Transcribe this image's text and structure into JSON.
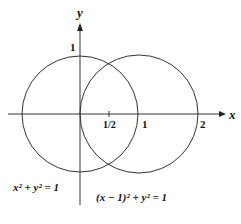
{
  "diagram": {
    "axes": {
      "x_label": "x",
      "y_label": "y",
      "ticks": {
        "x_half": "1/2",
        "x_one": "1",
        "x_two": "2",
        "y_one": "1"
      }
    },
    "curves": [
      {
        "equation": "x² + y² = 1",
        "center": [
          0,
          0
        ],
        "radius": 1
      },
      {
        "equation": "(x − 1)² + y² = 1",
        "center": [
          1,
          0
        ],
        "radius": 1
      }
    ],
    "labels": {
      "circle_left": "x² + y² = 1",
      "circle_right": "(x − 1)² + y² = 1"
    },
    "colors": {
      "stroke": "#222222",
      "background": "#ffffff"
    }
  }
}
